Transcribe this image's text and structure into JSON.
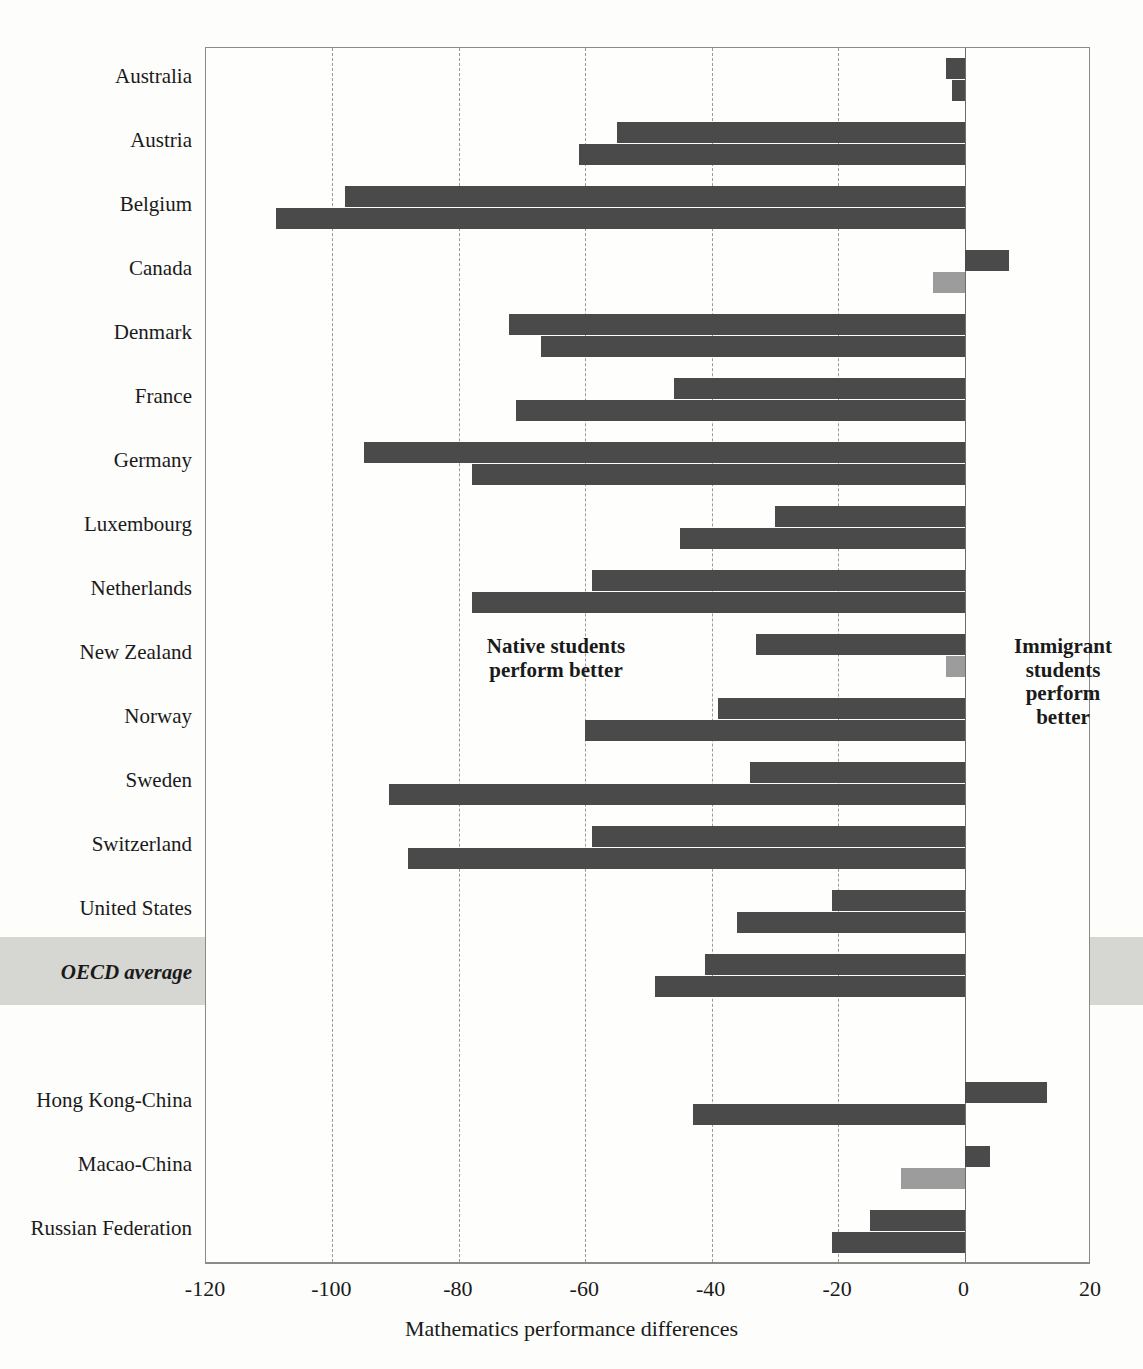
{
  "chart_data": {
    "type": "bar",
    "orientation": "horizontal",
    "title": "",
    "xlabel": "Mathematics performance differences",
    "ylabel": "",
    "xlim": [
      -120,
      20
    ],
    "xticks": [
      "-120",
      "-100",
      "-80",
      "-60",
      "-40",
      "-20",
      "0",
      "20"
    ],
    "xtick_values": [
      -120,
      -100,
      -80,
      -60,
      -40,
      -20,
      0,
      20
    ],
    "grid": "vertical-dashed",
    "legend": "none",
    "categories": [
      "Australia",
      "Austria",
      "Belgium",
      "Canada",
      "Denmark",
      "France",
      "Germany",
      "Luxembourg",
      "Netherlands",
      "New Zealand",
      "Norway",
      "Sweden",
      "Switzerland",
      "United States",
      "OECD average",
      "Hong Kong-China",
      "Macao-China",
      "Russian Federation"
    ],
    "series": [
      {
        "name": "First-generation students vs native students",
        "color": "#4a4a4a",
        "values": [
          -3,
          -55,
          -98,
          7,
          -72,
          -46,
          -95,
          -30,
          -59,
          -33,
          -39,
          -34,
          -59,
          -21,
          -41,
          13,
          4,
          -15
        ]
      },
      {
        "name": "Second-generation students vs native students",
        "color": "#4a4a4a",
        "values": [
          -2,
          -61,
          -109,
          -5,
          -67,
          -71,
          -78,
          -45,
          -78,
          -3,
          -60,
          -91,
          -88,
          -36,
          -49,
          -43,
          -10,
          -21
        ]
      }
    ],
    "highlight_row": "OECD average",
    "annotations": [
      {
        "name": "native-better",
        "text": "Native students\nperform better",
        "side": "left"
      },
      {
        "name": "immigrant-better",
        "text": "Immigrant\nstudents\nperform\nbetter",
        "side": "right"
      }
    ]
  },
  "annotations": {
    "native_line1": "Native students",
    "native_line2": "perform better",
    "immigrant_line1": "Immigrant",
    "immigrant_line2": "students",
    "immigrant_line3": "perform",
    "immigrant_line4": "better"
  },
  "axis": {
    "title": "Mathematics performance differences"
  },
  "colors": {
    "bar_dark": "#4a4a4a",
    "bar_light": "#9c9c9c",
    "highlight_band": "#d6d6d2",
    "grid": "#9a9a96",
    "axis": "#8a8a86"
  }
}
